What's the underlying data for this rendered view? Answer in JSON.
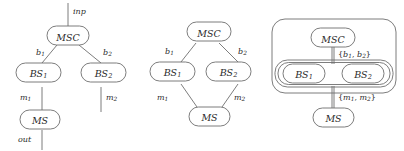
{
  "figure": {
    "kind": "graph-diagram-triptych",
    "stroke_color": "#6e6e6e",
    "text_color": "#2a2a2a",
    "background": "#ffffff"
  },
  "panels": [
    {
      "id": "panel-left",
      "nodes": [
        {
          "id": "msc",
          "label": "MSC",
          "sub": ""
        },
        {
          "id": "bs1",
          "label": "BS",
          "sub": "1"
        },
        {
          "id": "bs2",
          "label": "BS",
          "sub": "2"
        },
        {
          "id": "ms",
          "label": "MS",
          "sub": ""
        }
      ],
      "edge_labels": [
        {
          "id": "inp",
          "label": "inp",
          "sub": ""
        },
        {
          "id": "b1",
          "label": "b",
          "sub": "1"
        },
        {
          "id": "b2",
          "label": "b",
          "sub": "2"
        },
        {
          "id": "m1",
          "label": "m",
          "sub": "1"
        },
        {
          "id": "m2",
          "label": "m",
          "sub": "2"
        },
        {
          "id": "out",
          "label": "out",
          "sub": ""
        }
      ]
    },
    {
      "id": "panel-middle",
      "nodes": [
        {
          "id": "msc",
          "label": "MSC",
          "sub": ""
        },
        {
          "id": "bs1",
          "label": "BS",
          "sub": "1"
        },
        {
          "id": "bs2",
          "label": "BS",
          "sub": "2"
        },
        {
          "id": "ms",
          "label": "MS",
          "sub": ""
        }
      ],
      "edge_labels": [
        {
          "id": "b1",
          "label": "b",
          "sub": "1"
        },
        {
          "id": "b2",
          "label": "b",
          "sub": "2"
        },
        {
          "id": "m1",
          "label": "m",
          "sub": "1"
        },
        {
          "id": "m2",
          "label": "m",
          "sub": "2"
        }
      ]
    },
    {
      "id": "panel-right",
      "nodes": [
        {
          "id": "msc",
          "label": "MSC",
          "sub": ""
        },
        {
          "id": "bs1",
          "label": "BS",
          "sub": "1"
        },
        {
          "id": "bs2",
          "label": "BS",
          "sub": "2"
        },
        {
          "id": "ms",
          "label": "MS",
          "sub": ""
        }
      ],
      "set_labels": [
        {
          "id": "b-set",
          "open": "{",
          "a": "b",
          "asub": "1",
          "comma": ", ",
          "b": "b",
          "bsub": "2",
          "close": "}"
        },
        {
          "id": "m-set",
          "open": "{",
          "a": "m",
          "asub": "1",
          "comma": ", ",
          "b": "m",
          "bsub": "2",
          "close": "}"
        }
      ]
    }
  ]
}
